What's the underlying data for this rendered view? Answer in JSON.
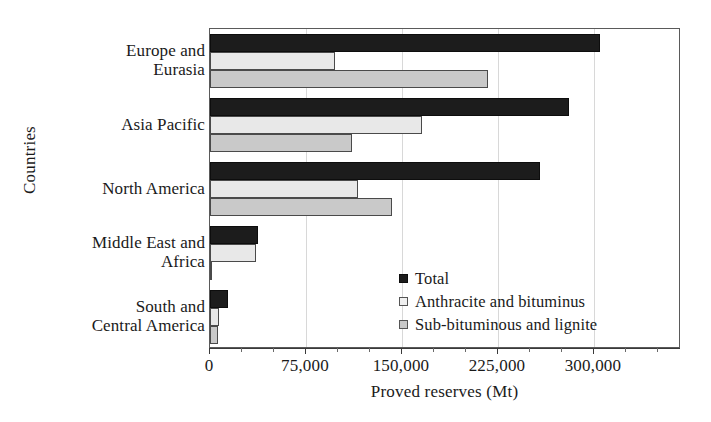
{
  "chart_data": {
    "type": "bar",
    "orientation": "horizontal",
    "title": "",
    "xlabel": "Proved reserves (Mt)",
    "ylabel": "Countries",
    "categories": [
      "Europe and Eurasia",
      "Asia Pacific",
      "North America",
      "Middle East and Africa",
      "South and Central America"
    ],
    "series": [
      {
        "name": "Total",
        "color": "#1c1c1c",
        "values": [
          304600,
          280800,
          257800,
          37200,
          13800
        ]
      },
      {
        "name": "Anthracite and bituminus",
        "color": "#e8e8e8",
        "values": [
          97700,
          166000,
          115700,
          36000,
          7200
        ]
      },
      {
        "name": "Sub-bituminous and lignite",
        "color": "#c9c9c9",
        "values": [
          216900,
          111100,
          142100,
          1200,
          6600
        ]
      }
    ],
    "xlim": [
      0,
      368000
    ],
    "xticks": [
      0,
      75000,
      150000,
      225000,
      300000
    ],
    "xtick_labels": [
      "0",
      "75,000",
      "150,000",
      "225,000",
      "300,000"
    ],
    "xtick_minor_step": 25000,
    "grid": "vertical",
    "legend_position": "inside-lower-right"
  },
  "axis": {
    "y_title": "Countries",
    "x_title": "Proved reserves (Mt)"
  },
  "legend": {
    "items": [
      {
        "label": "Total",
        "swatch": "total"
      },
      {
        "label": "Anthracite and bituminus",
        "swatch": "anth"
      },
      {
        "label": "Sub-bituminous and lignite",
        "swatch": "sub"
      }
    ]
  }
}
